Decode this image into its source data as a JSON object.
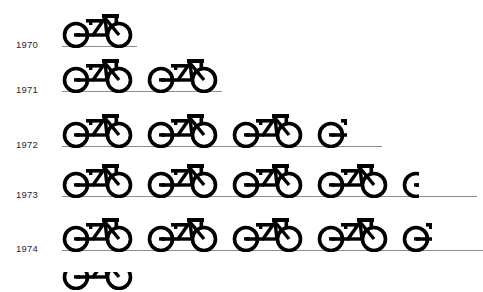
{
  "chart_data": {
    "type": "bar",
    "subtype": "pictogram-isotype",
    "title": "",
    "subtitle": "",
    "xlabel": "",
    "ylabel": "",
    "icon": "bicycle-icon",
    "icon_unit_label": "bicycle",
    "categories": [
      "1970",
      "1971",
      "1972",
      "1973",
      "1974"
    ],
    "values": [
      1,
      2,
      3.4,
      4.22,
      4.4
    ],
    "full_icons": [
      1,
      2,
      3,
      4,
      4
    ],
    "partial_fraction": [
      0,
      0,
      0.4,
      0.22,
      0.4
    ],
    "series": [
      {
        "name": "Bicycles",
        "values": [
          1,
          2,
          3.4,
          4.22,
          4.4
        ]
      }
    ],
    "grid": false,
    "legend": "none",
    "xlim": [
      0,
      5
    ],
    "colors": {
      "icon": "#000000",
      "baseline": "#8c8c8c",
      "label_text": "#2b2b2b",
      "background": "#ffffff"
    }
  },
  "rows": [
    {
      "year": "1970",
      "full": 1,
      "partial": 0,
      "baseline_left": 62,
      "baseline_width": 75,
      "top": 8,
      "baseline_y": 46,
      "label_y": 39
    },
    {
      "year": "1971",
      "full": 2,
      "partial": 0,
      "baseline_left": 62,
      "baseline_width": 160,
      "top": 53,
      "baseline_y": 91,
      "label_y": 84
    },
    {
      "year": "1972",
      "full": 3,
      "partial": 0.4,
      "baseline_left": 62,
      "baseline_width": 320,
      "top": 108,
      "baseline_y": 146,
      "label_y": 139
    },
    {
      "year": "1973",
      "full": 4,
      "partial": 0.22,
      "baseline_left": 62,
      "baseline_width": 415,
      "top": 158,
      "baseline_y": 196,
      "label_y": 189
    },
    {
      "year": "1974",
      "full": 4,
      "partial": 0.4,
      "baseline_left": 62,
      "baseline_width": 421,
      "top": 212,
      "baseline_y": 250,
      "label_y": 243
    }
  ],
  "bottom_fragment": {
    "present": true,
    "description": "cropped-bicycle-top"
  },
  "icon_spacing": 85
}
